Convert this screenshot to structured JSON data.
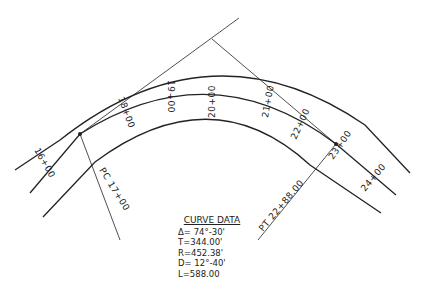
{
  "curve_data": {
    "title": "CURVE DATA",
    "delta": "Δ= 74°-30'",
    "tangent": "T=344.00'",
    "radius": "R=452.38'",
    "degree": "D= 12°-40'",
    "length": "L=588.00"
  },
  "stations": {
    "s16": "16+00",
    "s18": "18+00",
    "s19": "19+00",
    "s20": "20+00",
    "s21": "21+00",
    "s22": "22+00",
    "s23": "23+00",
    "s24": "24+00"
  },
  "points": {
    "pc": "PC 17+00",
    "pt": "PT 22+88.00"
  }
}
